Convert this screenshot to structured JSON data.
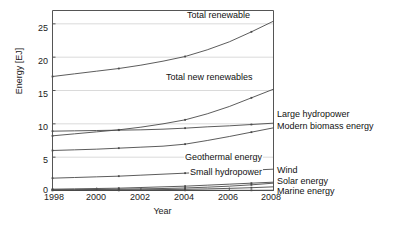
{
  "chart_data": {
    "type": "line",
    "title": "",
    "xlabel": "Year",
    "ylabel": "Energy [EJ]",
    "xlim": [
      1998,
      2008
    ],
    "ylim": [
      0,
      27
    ],
    "xticks": [
      1998,
      2000,
      2002,
      2004,
      2006,
      2008
    ],
    "yticks": [
      0,
      5,
      10,
      15,
      20,
      25
    ],
    "grid": true,
    "legend_position": "inline-annotations-and-right-edge-labels",
    "x": [
      1998,
      1999,
      2000,
      2001,
      2002,
      2003,
      2004,
      2005,
      2006,
      2007,
      2008
    ],
    "series": [
      {
        "name": "Total renewable",
        "label_placement": "inside-top",
        "values": [
          17.1,
          17.5,
          17.9,
          18.3,
          18.8,
          19.4,
          20.1,
          21.1,
          22.3,
          23.8,
          25.4
        ]
      },
      {
        "name": "Total new renewables",
        "label_placement": "inside-middle",
        "values": [
          8.2,
          8.5,
          8.8,
          9.1,
          9.5,
          10.0,
          10.6,
          11.5,
          12.6,
          13.9,
          15.2
        ]
      },
      {
        "name": "Large hydropower",
        "label_placement": "right-edge",
        "values": [
          8.9,
          8.95,
          9.0,
          9.05,
          9.1,
          9.2,
          9.35,
          9.55,
          9.7,
          9.9,
          10.1
        ]
      },
      {
        "name": "Modern biomass energy",
        "label_placement": "right-edge",
        "values": [
          6.0,
          6.1,
          6.2,
          6.35,
          6.5,
          6.65,
          6.95,
          7.5,
          8.1,
          8.75,
          9.4
        ]
      },
      {
        "name": "Geothermal energy",
        "label_placement": "inside-lower",
        "values": [
          1.85,
          1.95,
          2.05,
          2.15,
          2.3,
          2.45,
          2.6,
          2.75,
          2.9,
          3.05,
          3.2
        ]
      },
      {
        "name": "Small hydropower",
        "label_placement": "inside-lower",
        "values": [
          0.2,
          0.25,
          0.3,
          0.35,
          0.45,
          0.55,
          0.65,
          0.8,
          0.95,
          1.1,
          1.25
        ]
      },
      {
        "name": "Wind",
        "label_placement": "right-edge",
        "values": [
          0.1,
          0.12,
          0.15,
          0.2,
          0.25,
          0.3,
          0.38,
          0.5,
          0.65,
          0.85,
          1.1
        ]
      },
      {
        "name": "Solar energy",
        "label_placement": "right-edge",
        "values": [
          0.05,
          0.06,
          0.07,
          0.09,
          0.11,
          0.14,
          0.18,
          0.24,
          0.32,
          0.42,
          0.55
        ]
      },
      {
        "name": "Marine energy",
        "label_placement": "right-edge",
        "values": [
          0.02,
          0.02,
          0.02,
          0.02,
          0.02,
          0.02,
          0.03,
          0.03,
          0.03,
          0.03,
          0.04
        ]
      }
    ]
  },
  "axes": {
    "ylabel": "Energy [EJ]",
    "xlabel": "Year",
    "yticks": [
      "25",
      "20",
      "15",
      "10",
      "5",
      "0"
    ],
    "xticks": [
      "1998",
      "2000",
      "2002",
      "2004",
      "2006",
      "2008"
    ]
  },
  "annotations": {
    "total_renewable": "Total renewable",
    "total_new_renewables": "Total new renewables",
    "geothermal": "Geothermal energy",
    "small_hydropower": "Small hydropower"
  },
  "right_labels": {
    "large_hydropower": "Large hydropower",
    "modern_biomass": "Modern biomass energy",
    "wind": "Wind",
    "solar": "Solar energy",
    "marine": "Marine energy"
  },
  "colors": {
    "line": "#4a4a4a",
    "grid": "#d0d0d0",
    "axis": "#555555",
    "text": "#1a1a1a",
    "background": "#ffffff"
  }
}
